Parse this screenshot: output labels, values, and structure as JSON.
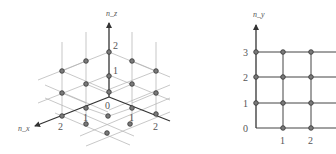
{
  "left_diagram": {
    "title": "3D lattice of quantum numbers",
    "axes": {
      "z": "n_z",
      "x": "n_x",
      "y": "n_y"
    },
    "z_ticks": [
      "2",
      "1"
    ],
    "origin_label": "0",
    "x_ticks": [
      "1",
      "2"
    ],
    "y_ticks": [
      "1",
      "2"
    ]
  },
  "right_diagram": {
    "title": "2D lattice of quantum numbers",
    "axes": {
      "y": "n_y",
      "x": "n_x"
    },
    "y_ticks": [
      "3",
      "2",
      "1",
      "0"
    ],
    "x_ticks": [
      "1",
      "2"
    ]
  },
  "colors": {
    "dot_fill": "#7a7a7a",
    "axis": "#333333",
    "grid": "#b0b0b0"
  }
}
